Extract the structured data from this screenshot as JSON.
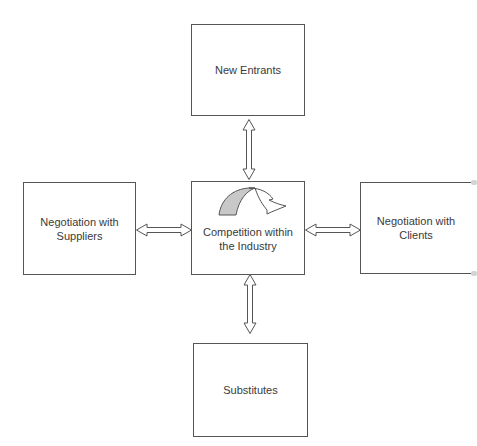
{
  "diagram": {
    "type": "five-forces",
    "nodes": {
      "top": {
        "label": "New Entrants"
      },
      "left": {
        "label_line1": "Negotiation with",
        "label_line2": "Suppliers"
      },
      "center": {
        "label_line1": "Competition within",
        "label_line2": "the Industry",
        "icon": "curved-arrow-icon"
      },
      "right": {
        "label_line1": "Negotiation with",
        "label_line2": "Clients"
      },
      "bottom": {
        "label": "Substitutes"
      }
    },
    "edges": [
      {
        "from": "top",
        "to": "center",
        "style": "double-headed-hollow-arrow"
      },
      {
        "from": "left",
        "to": "center",
        "style": "double-headed-hollow-arrow"
      },
      {
        "from": "right",
        "to": "center",
        "style": "double-headed-hollow-arrow"
      },
      {
        "from": "bottom",
        "to": "center",
        "style": "double-headed-hollow-arrow"
      }
    ],
    "colors": {
      "border": "#555555",
      "text": "#3a3a3a",
      "icon_fill": "#c8c8c8"
    }
  }
}
